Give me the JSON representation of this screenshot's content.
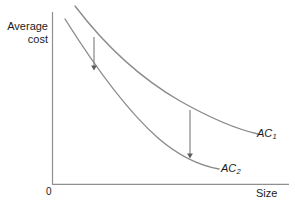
{
  "figure": {
    "title": "",
    "background_color": "#ffffff",
    "axis_color": "#8f8f8f",
    "curve_color": "#8a8a8a",
    "arrow_color": "#6e6e6e",
    "text_color": "#1a1a1a"
  },
  "axes": {
    "y_title_line1": "Average",
    "y_title_line2": "cost",
    "x_title": "Size",
    "origin_label": "0"
  },
  "curves": [
    {
      "name": "AC1",
      "label_text": "AC",
      "label_subscript": "1",
      "path": "M 75,6 C 104,44 140,78 180,101 C 212,119 240,130 258,134",
      "color": "#8a8a8a"
    },
    {
      "name": "AC2",
      "label_text": "AC",
      "label_subscript": "2",
      "path": "M 65,19 C 92,62 124,108 158,138 C 180,157 202,166 219,169",
      "color": "#8a8a8a"
    }
  ],
  "annotations": [
    {
      "name": "shift-arrow-left",
      "x": 94,
      "y_start": 37,
      "y_end": 73,
      "color": "#6e6e6e"
    },
    {
      "name": "shift-arrow-right",
      "x": 190,
      "y_start": 110,
      "y_end": 161,
      "color": "#6e6e6e"
    }
  ],
  "chart_data": {
    "type": "line",
    "title": "",
    "xlabel": "Size",
    "ylabel": "Average cost",
    "grid": false,
    "legend": "inline-right",
    "axis_ticks": {
      "x": [
        "0"
      ],
      "y": []
    },
    "annotations": [
      "Downward arrow from AC1 to AC2 at small size",
      "Downward arrow from AC1 to AC2 at large size"
    ],
    "series": [
      {
        "name": "AC1",
        "label": "AC1",
        "comment": "Upper long-run average cost curve, downward sloping and convex",
        "x": [
          0.09,
          0.18,
          0.27,
          0.36,
          0.45,
          0.54,
          0.63,
          0.72,
          0.81,
          0.9
        ],
        "y": [
          0.96,
          0.84,
          0.74,
          0.66,
          0.59,
          0.53,
          0.48,
          0.44,
          0.41,
          0.39
        ]
      },
      {
        "name": "AC2",
        "label": "AC2",
        "comment": "Lower long-run average cost curve after cost-reducing shift",
        "x": [
          0.05,
          0.14,
          0.23,
          0.32,
          0.41,
          0.5,
          0.59,
          0.68,
          0.71,
          0.74
        ],
        "y": [
          0.89,
          0.72,
          0.58,
          0.46,
          0.36,
          0.28,
          0.22,
          0.18,
          0.16,
          0.15
        ]
      }
    ],
    "xlim": [
      0,
      1
    ],
    "ylim": [
      0,
      1
    ]
  }
}
